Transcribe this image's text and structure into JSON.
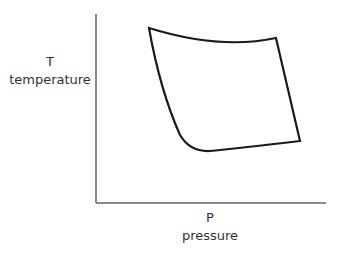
{
  "diagram": {
    "y_axis": {
      "symbol": "T",
      "label": "temperature"
    },
    "x_axis": {
      "symbol": "P",
      "label": "pressure"
    },
    "colors": {
      "axis": "#555555",
      "curve": "#1a1a1a",
      "text": "#333333"
    },
    "cycle": {
      "shape": "closed loop with four corners",
      "corners": [
        [
          149,
          28
        ],
        [
          276,
          38
        ],
        [
          300,
          141
        ],
        [
          200,
          150
        ]
      ]
    }
  }
}
